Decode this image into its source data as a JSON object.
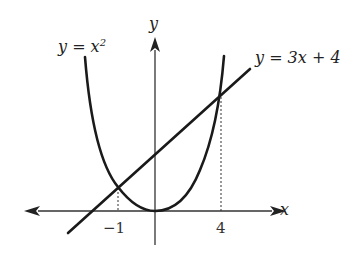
{
  "diagram": {
    "type": "function-graph",
    "curves": [
      {
        "name": "parabola",
        "equation_label": "y = x",
        "exponent": "2",
        "expression": "y = x^2"
      },
      {
        "name": "line",
        "equation_label": "y = 3x + 4",
        "expression": "y = 3x + 4"
      }
    ],
    "axes": {
      "x_label": "x",
      "y_label": "y"
    },
    "intersection_ticks": [
      {
        "x": -1,
        "label": "−1"
      },
      {
        "x": 4,
        "label": "4"
      }
    ],
    "colors": {
      "curve": "#1a1a1a",
      "axis": "#333333",
      "background": "#ffffff"
    }
  }
}
